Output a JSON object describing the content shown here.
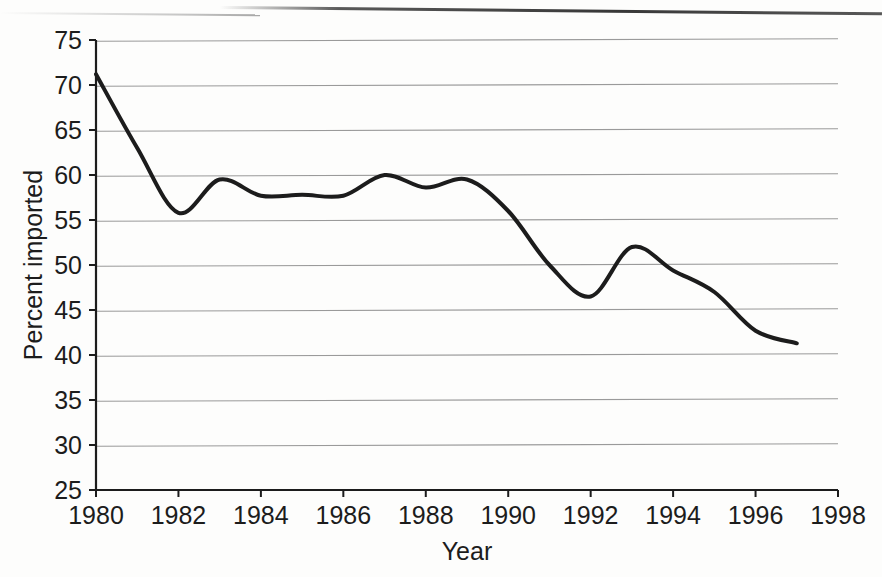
{
  "figure": {
    "background_color": "#fdfdfc",
    "ink_color": "#1c1c1c",
    "grid_color": "#9a9a9a"
  },
  "chart_data": {
    "type": "line",
    "title": "",
    "subtitle": "",
    "xlabel": "Year",
    "ylabel": "Percent imported",
    "xlim": [
      1980,
      1998
    ],
    "ylim": [
      25,
      75
    ],
    "xticks": [
      1980,
      1982,
      1984,
      1986,
      1988,
      1990,
      1992,
      1994,
      1996,
      1998
    ],
    "xtick_labels": [
      "1980",
      "1982",
      "1984",
      "1986",
      "1988",
      "1990",
      "1992",
      "1994",
      "1996",
      "1998"
    ],
    "yticks": [
      25,
      30,
      35,
      40,
      45,
      50,
      55,
      60,
      65,
      70,
      75
    ],
    "ytick_labels": [
      "25",
      "30",
      "35",
      "40",
      "45",
      "50",
      "55",
      "60",
      "65",
      "70",
      "75"
    ],
    "grid": "horizontal",
    "legend": "none",
    "annotations": [],
    "series": [
      {
        "name": "Percent imported",
        "color": "#1c1c1c",
        "line_width": 4,
        "x": [
          1980,
          1981,
          1982,
          1983,
          1984,
          1985,
          1986,
          1987,
          1988,
          1989,
          1990,
          1991,
          1992,
          1993,
          1994,
          1995,
          1996,
          1997
        ],
        "values": [
          71.2,
          63.0,
          55.8,
          59.5,
          57.7,
          57.8,
          57.7,
          60.0,
          58.6,
          59.5,
          56.0,
          50.0,
          46.5,
          52.0,
          49.4,
          47.0,
          42.7,
          41.3
        ]
      }
    ]
  }
}
